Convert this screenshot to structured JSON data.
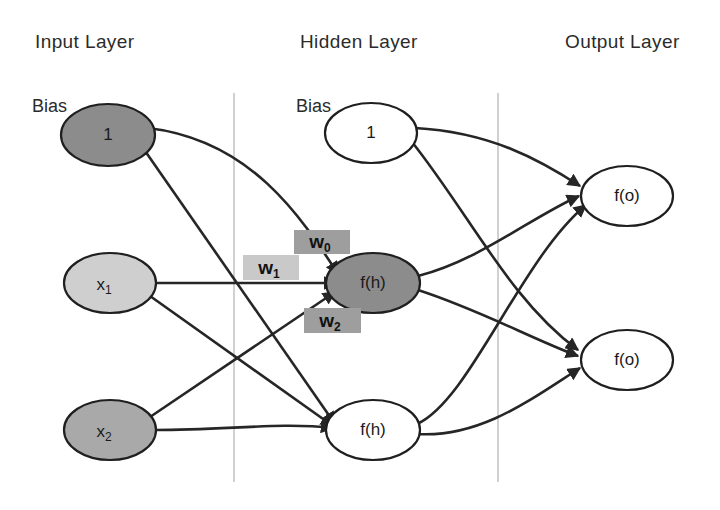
{
  "diagram": {
    "background_color": "#ffffff",
    "edge_color": "#262626",
    "divider_color": "#bdbdbd",
    "layers": [
      {
        "id": "input",
        "title": "Input Layer"
      },
      {
        "id": "hidden",
        "title": "Hidden Layer"
      },
      {
        "id": "output",
        "title": "Output Layer"
      }
    ],
    "labels": {
      "input_bias_caption": "Bias",
      "hidden_bias_caption": "Bias"
    },
    "nodes": {
      "input_bias": {
        "label": "1",
        "fill": "#8c8c8c"
      },
      "input_x1": {
        "label": "x",
        "subscript": "1",
        "fill": "#cfcfcf"
      },
      "input_x2": {
        "label": "x",
        "subscript": "2",
        "fill": "#a9a9a9"
      },
      "hidden_bias": {
        "label": "1",
        "fill": "#ffffff"
      },
      "hidden_h1": {
        "label": "f(h)",
        "fill": "#8c8c8c"
      },
      "hidden_h2": {
        "label": "f(h)",
        "fill": "#ffffff"
      },
      "output_o1": {
        "label": "f(o)",
        "fill": "#ffffff"
      },
      "output_o2": {
        "label": "f(o)",
        "fill": "#ffffff"
      }
    },
    "weights": [
      {
        "id": "w0",
        "label": "w",
        "subscript": "0",
        "box_fill": "#9e9e9e"
      },
      {
        "id": "w1",
        "label": "w",
        "subscript": "1",
        "box_fill": "#c9c9c9"
      },
      {
        "id": "w2",
        "label": "w",
        "subscript": "2",
        "box_fill": "#9e9e9e"
      }
    ]
  }
}
